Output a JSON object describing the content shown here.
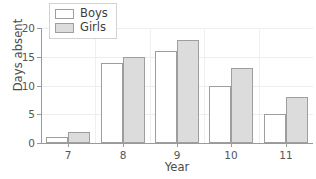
{
  "chart_data": {
    "type": "bar",
    "title": "",
    "xlabel": "Year",
    "ylabel": "Days absent",
    "categories": [
      "7",
      "8",
      "9",
      "10",
      "11"
    ],
    "series": [
      {
        "name": "Boys",
        "values": [
          1,
          14,
          16,
          10,
          5
        ]
      },
      {
        "name": "Girls",
        "values": [
          2,
          15,
          18,
          13,
          8
        ]
      }
    ],
    "ylim": [
      0,
      20
    ],
    "yticks": [
      0,
      5,
      10,
      15,
      20
    ],
    "ytick_labels": [
      "0",
      "5",
      "10",
      "15",
      "20"
    ],
    "grid": "horizontal-and-vertical",
    "legend_position": "top-left-inside",
    "legend_entries": [
      "Boys",
      "Girls"
    ],
    "colors": {
      "boys_fill": "#ffffff",
      "girls_fill": "#dcdcdc",
      "bar_border": "#9e9e9e",
      "axis": "#9a9a9a",
      "gridline": "#ededed",
      "text": "#3d3d3d",
      "background": "#ffffff"
    }
  }
}
